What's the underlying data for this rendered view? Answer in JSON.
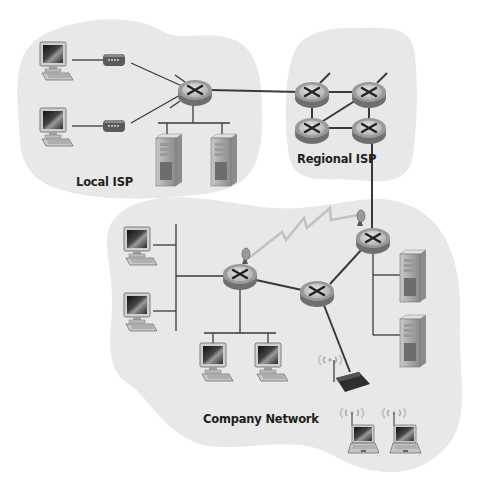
{
  "regions": {
    "local_isp": {
      "label": "Local ISP"
    },
    "regional_isp": {
      "label": "Regional ISP"
    },
    "company_network": {
      "label": "Company Network"
    }
  },
  "colors": {
    "cloud_fill": "#e8e8e8",
    "link": "#3a3a3a",
    "wireless_link": "#bdbdbd",
    "router_body": "#8f8f8f",
    "router_top": "#d6d6d6"
  },
  "nodes": {
    "local_isp": {
      "hosts": 2,
      "modems": 2,
      "routers": 1,
      "servers": 2
    },
    "regional_isp": {
      "routers": 4
    },
    "company_network": {
      "routers": 3,
      "desktops": 4,
      "servers": 2,
      "wireless_access_points": 1,
      "laptops": 2,
      "satellite_dishes": 2
    }
  }
}
